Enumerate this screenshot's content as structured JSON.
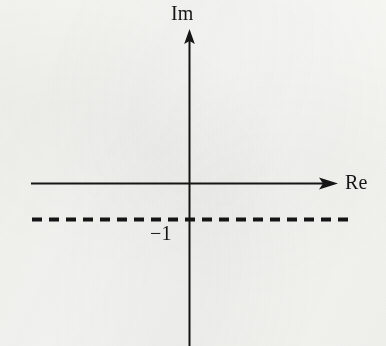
{
  "figure": {
    "background_color": "#f8f8f6",
    "ink_color": "#151515",
    "corner_mark": ")",
    "imaginary_axis_label": "Im",
    "real_axis_label": "Re",
    "tick_label": "−1"
  },
  "chart_data": {
    "type": "line",
    "title": "",
    "subtitle": "",
    "xlabel": "Re",
    "ylabel": "Im",
    "grid": false,
    "legend": "none",
    "axes": {
      "real": {
        "label": "Re",
        "orientation": "horizontal",
        "arrow": "right",
        "y_pixel": 183,
        "x_start_pixel": 31,
        "x_end_pixel": 338
      },
      "imaginary": {
        "label": "Im",
        "orientation": "vertical",
        "arrow": "up",
        "x_pixel": 189,
        "y_start_pixel": 346,
        "y_end_pixel": 30
      },
      "origin_pixel": [
        189,
        183
      ]
    },
    "series": [
      {
        "name": "Im = -1",
        "style": "dashed",
        "orientation": "horizontal",
        "y_value": -1,
        "tick_label": "−1",
        "y_pixel": 219,
        "x_start_pixel": 32,
        "x_end_pixel": 352,
        "dash_length": 10,
        "gap_length": 7,
        "stroke_width": 4
      }
    ],
    "annotations": [
      {
        "text": "Im",
        "x_pixel": 188,
        "y_pixel": 14,
        "role": "axis-title"
      },
      {
        "text": "Re",
        "x_pixel": 362,
        "y_pixel": 183,
        "role": "axis-title"
      },
      {
        "text": "−1",
        "x_pixel": 166,
        "y_pixel": 233,
        "role": "tick-label"
      }
    ]
  }
}
